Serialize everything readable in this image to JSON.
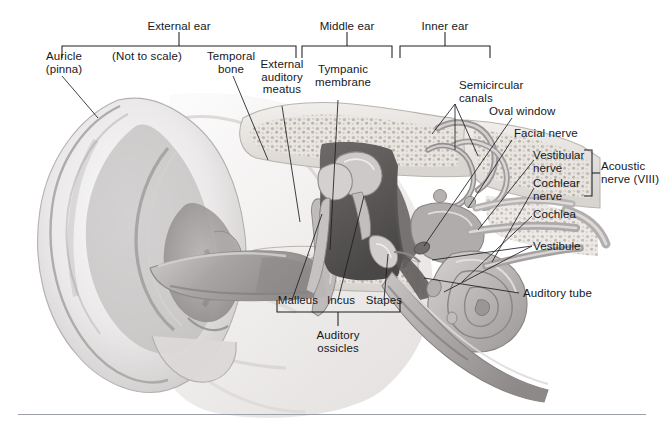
{
  "figure": {
    "note": "(Not to scale)",
    "type": "anatomical-illustration",
    "style": "grayscale pencil/airbrush medical illustration",
    "background": "#ffffff",
    "ink": "#1d1f23"
  },
  "region_brackets": [
    {
      "id": "external-ear",
      "label": "External ear"
    },
    {
      "id": "middle-ear",
      "label": "Middle ear"
    },
    {
      "id": "inner-ear",
      "label": "Inner ear"
    }
  ],
  "labels": {
    "auricle": "Auricle\n(pinna)",
    "not_to_scale": "(Not to scale)",
    "temporal_bone": "Temporal\nbone",
    "external_auditory_meatus": "External\nauditory\nmeatus",
    "tympanic_membrane": "Tympanic\nmembrane",
    "semicircular_canals": "Semicircular\ncanals",
    "oval_window": "Oval window",
    "facial_nerve": "Facial nerve",
    "vestibular_nerve": "Vestibular\nnerve",
    "cochlear_nerve": "Cochlear\nnerve",
    "acoustic_nerve": "Acoustic\nnerve (VIII)",
    "cochlea": "Cochlea",
    "vestibule": "Vestibule",
    "auditory_tube": "Auditory tube",
    "malleus": "Malleus",
    "incus": "Incus",
    "stapes": "Stapes",
    "auditory_ossicles": "Auditory\nossicles"
  },
  "ossicle_bracket": {
    "members": [
      "Malleus",
      "Incus",
      "Stapes"
    ],
    "label": "Auditory\nossicles"
  },
  "nerve_bracket": {
    "members": [
      "Vestibular nerve",
      "Cochlear nerve"
    ],
    "label": "Acoustic nerve (VIII)"
  },
  "footer_rule": {
    "present": true,
    "color": "#9aa0a6"
  }
}
